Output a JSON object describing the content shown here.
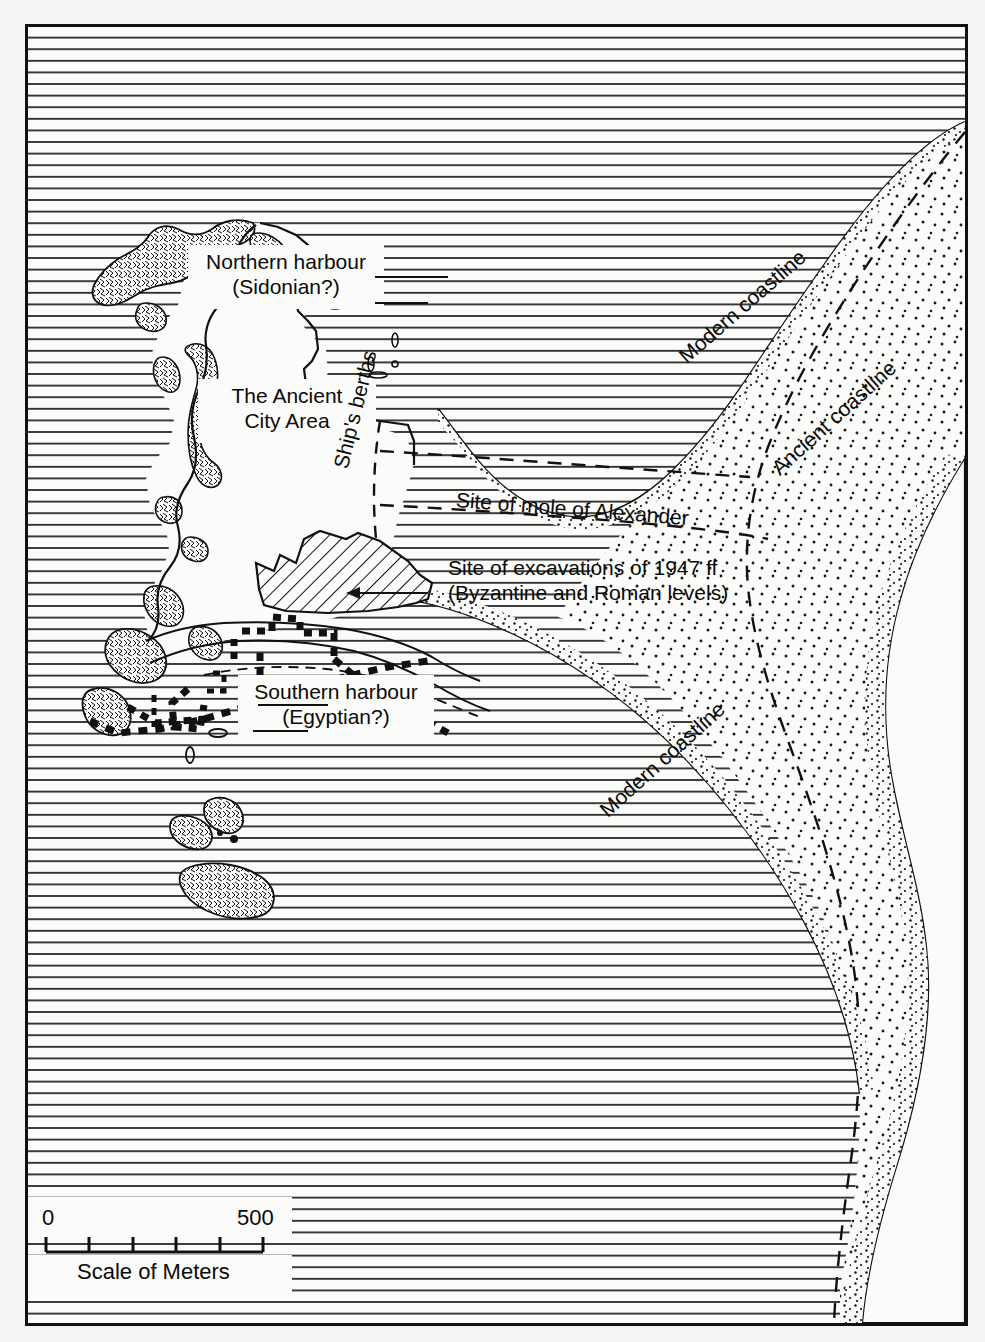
{
  "map": {
    "title": "Ancient Alexandria harbours map",
    "labels": {
      "northern_harbour_l1": "Northern harbour",
      "northern_harbour_l2": "(Sidonian?)",
      "ancient_city_l1": "The Ancient",
      "ancient_city_l2": "City Area",
      "ships_berths": "Ship's berths",
      "mole_of_alexander": "Site of mole of Alexander",
      "excavations_l1": "Site of excavations of 1947 ff",
      "excavations_l2": "(Byzantine and Roman levels)",
      "southern_harbour_l1": "Southern harbour",
      "southern_harbour_l2": "(Egyptian?)",
      "modern_coastline_north": "Modern coastline",
      "modern_coastline_south": "Modern coastline",
      "ancient_coastline": "Ancient coastline"
    },
    "scale": {
      "start": "0",
      "end": "500",
      "caption": "Scale of Meters",
      "divisions": 5
    },
    "colors": {
      "ink": "#111111",
      "paper": "#fbfbf9",
      "sea_hatch": "#222222",
      "sand_stipple": "#1a1a1a"
    }
  }
}
